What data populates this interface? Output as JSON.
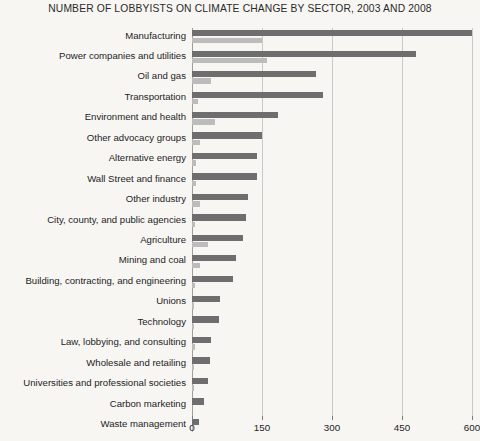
{
  "chart_data": {
    "type": "bar",
    "orientation": "horizontal",
    "title": "NUMBER OF LOBBYISTS ON CLIMATE CHANGE BY SECTOR, 2003 AND 2008",
    "xlabel": "",
    "ylabel": "",
    "xlim": [
      0,
      600
    ],
    "xticks": [
      0,
      150,
      300,
      450,
      600
    ],
    "xtick_labels": [
      "0",
      "150",
      "300",
      "450",
      "600"
    ],
    "grid": "vertical",
    "legend_position": "none",
    "categories": [
      "Manufacturing",
      "Power companies and utilities",
      "Oil and gas",
      "Transportation",
      "Environment and health",
      "Other advocacy groups",
      "Alternative energy",
      "Wall Street and finance",
      "Other industry",
      "City, county, and public agencies",
      "Agriculture",
      "Mining and coal",
      "Building, contracting, and engineering",
      "Unions",
      "Technology",
      "Law, lobbying, and consulting",
      "Wholesale and retailing",
      "Universities and professional societies",
      "Carbon marketing",
      "Waste management"
    ],
    "series": [
      {
        "name": "2008",
        "color": "#6e6e6e",
        "values": [
          600,
          480,
          265,
          280,
          185,
          150,
          140,
          140,
          120,
          115,
          110,
          95,
          88,
          60,
          58,
          40,
          38,
          35,
          26,
          14
        ]
      },
      {
        "name": "2003",
        "color": "#bcbcbc",
        "values": [
          150,
          160,
          40,
          12,
          50,
          18,
          8,
          8,
          18,
          6,
          35,
          18,
          6,
          4,
          4,
          6,
          4,
          4,
          0,
          2
        ]
      }
    ]
  }
}
